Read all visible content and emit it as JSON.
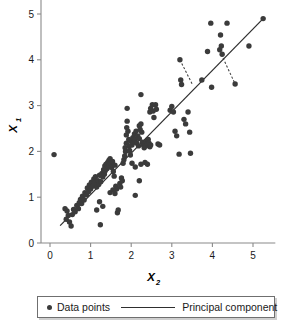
{
  "chart_data": {
    "type": "scatter",
    "title": "",
    "xlabel": "X",
    "xlabel_sub": "2",
    "ylabel": "X",
    "ylabel_sub": "1",
    "xlim": [
      -0.12,
      5.55
    ],
    "ylim": [
      -0.18,
      5.35
    ],
    "xticks": [
      0,
      1,
      2,
      3,
      4,
      5
    ],
    "yticks": [
      0,
      1,
      2,
      3,
      4,
      5
    ],
    "xticklabels": [
      "0",
      "1",
      "2",
      "3",
      "4",
      "5"
    ],
    "yticklabels": [
      "0",
      "1",
      "2",
      "3",
      "4",
      "5"
    ],
    "grid": false,
    "legend_position": "below-axes",
    "marker_color": "#3b3b3b",
    "line_color": "#2e2e2e",
    "axis_color": "#8a8a8a",
    "background": "#ffffff",
    "series": [
      {
        "name": "Data points",
        "type": "scatter",
        "marker": "circle",
        "color": "#3b3b3b",
        "points": [
          [
            0.1,
            1.93
          ],
          [
            0.37,
            0.75
          ],
          [
            0.42,
            0.7
          ],
          [
            0.45,
            0.6
          ],
          [
            0.4,
            0.52
          ],
          [
            0.48,
            0.46
          ],
          [
            0.52,
            0.37
          ],
          [
            0.55,
            0.62
          ],
          [
            0.58,
            0.73
          ],
          [
            0.62,
            0.68
          ],
          [
            0.66,
            0.82
          ],
          [
            0.7,
            0.75
          ],
          [
            0.72,
            0.88
          ],
          [
            0.75,
            0.95
          ],
          [
            0.78,
            0.86
          ],
          [
            0.8,
            1.02
          ],
          [
            0.84,
            0.94
          ],
          [
            0.86,
            1.1
          ],
          [
            0.9,
            1.05
          ],
          [
            0.92,
            1.2
          ],
          [
            0.95,
            1.12
          ],
          [
            0.97,
            1.27
          ],
          [
            1.0,
            1.18
          ],
          [
            1.02,
            1.33
          ],
          [
            1.05,
            1.24
          ],
          [
            1.08,
            1.4
          ],
          [
            1.1,
            1.3
          ],
          [
            1.12,
            1.45
          ],
          [
            1.15,
            1.22
          ],
          [
            1.18,
            1.36
          ],
          [
            1.2,
            1.28
          ],
          [
            1.22,
            1.48
          ],
          [
            1.24,
            0.4
          ],
          [
            1.25,
            1.34
          ],
          [
            1.28,
            1.52
          ],
          [
            1.3,
            1.44
          ],
          [
            1.32,
            1.6
          ],
          [
            1.34,
            1.5
          ],
          [
            1.35,
            1.68
          ],
          [
            1.36,
            1.58
          ],
          [
            1.38,
            1.72
          ],
          [
            1.4,
            1.62
          ],
          [
            1.42,
            1.76
          ],
          [
            1.44,
            1.66
          ],
          [
            1.45,
            1.8
          ],
          [
            1.46,
            1.7
          ],
          [
            1.48,
            1.84
          ],
          [
            1.5,
            1.74
          ],
          [
            1.52,
            1.65
          ],
          [
            1.54,
            1.78
          ],
          [
            1.56,
            1.56
          ],
          [
            1.58,
            1.46
          ],
          [
            1.6,
            1.7
          ],
          [
            1.62,
            1.24
          ],
          [
            1.64,
            1.18
          ],
          [
            1.66,
            0.66
          ],
          [
            1.68,
            0.72
          ],
          [
            1.15,
            0.72
          ],
          [
            1.22,
            0.9
          ],
          [
            1.3,
            0.8
          ],
          [
            1.48,
            1.1
          ],
          [
            1.55,
            1.16
          ],
          [
            1.6,
            1.08
          ],
          [
            1.72,
            1.3
          ],
          [
            1.74,
            1.22
          ],
          [
            1.76,
            1.42
          ],
          [
            1.78,
            1.36
          ],
          [
            1.8,
            1.74
          ],
          [
            1.82,
            1.82
          ],
          [
            1.84,
            1.9
          ],
          [
            1.85,
            2.08
          ],
          [
            1.86,
            2.0
          ],
          [
            1.88,
            2.18
          ],
          [
            1.88,
            2.36
          ],
          [
            1.89,
            2.52
          ],
          [
            1.9,
            2.66
          ],
          [
            1.9,
            2.94
          ],
          [
            1.92,
            2.44
          ],
          [
            1.94,
            2.26
          ],
          [
            1.95,
            2.12
          ],
          [
            1.96,
            2.02
          ],
          [
            1.98,
            1.92
          ],
          [
            2.0,
            2.22
          ],
          [
            2.02,
            2.14
          ],
          [
            2.04,
            2.3
          ],
          [
            2.06,
            2.2
          ],
          [
            2.08,
            2.38
          ],
          [
            2.1,
            2.26
          ],
          [
            2.12,
            2.44
          ],
          [
            2.14,
            2.18
          ],
          [
            2.16,
            2.34
          ],
          [
            2.18,
            2.12
          ],
          [
            2.2,
            2.28
          ],
          [
            2.2,
            2.56
          ],
          [
            2.22,
            2.48
          ],
          [
            2.24,
            2.6
          ],
          [
            2.24,
            3.24
          ],
          [
            2.26,
            2.42
          ],
          [
            2.28,
            2.2
          ],
          [
            2.3,
            2.14
          ],
          [
            2.32,
            2.08
          ],
          [
            2.34,
            2.18
          ],
          [
            2.36,
            2.12
          ],
          [
            2.38,
            2.22
          ],
          [
            2.4,
            2.16
          ],
          [
            2.42,
            2.26
          ],
          [
            2.44,
            2.18
          ],
          [
            2.46,
            2.1
          ],
          [
            2.48,
            2.14
          ],
          [
            2.1,
            1.04
          ],
          [
            2.2,
            1.36
          ],
          [
            2.02,
            1.74
          ],
          [
            2.1,
            1.66
          ],
          [
            2.24,
            1.72
          ],
          [
            2.34,
            1.76
          ],
          [
            2.4,
            1.72
          ],
          [
            2.46,
            2.86
          ],
          [
            2.48,
            2.94
          ],
          [
            2.52,
            3.02
          ],
          [
            2.54,
            2.88
          ],
          [
            2.56,
            2.74
          ],
          [
            2.6,
            3.02
          ],
          [
            2.62,
            2.92
          ],
          [
            2.66,
            2.16
          ],
          [
            2.7,
            2.14
          ],
          [
            2.96,
            2.9
          ],
          [
            3.0,
            2.98
          ],
          [
            3.04,
            2.86
          ],
          [
            3.08,
            2.44
          ],
          [
            3.12,
            2.34
          ],
          [
            3.18,
            1.94
          ],
          [
            3.2,
            4.0
          ],
          [
            3.22,
            3.56
          ],
          [
            3.24,
            3.46
          ],
          [
            3.3,
            2.7
          ],
          [
            3.34,
            2.6
          ],
          [
            3.4,
            2.86
          ],
          [
            3.44,
            2.42
          ],
          [
            3.46,
            1.96
          ],
          [
            3.74,
            3.56
          ],
          [
            3.88,
            4.18
          ],
          [
            3.96,
            4.8
          ],
          [
            3.98,
            3.4
          ],
          [
            4.18,
            4.22
          ],
          [
            4.2,
            4.54
          ],
          [
            4.22,
            4.3
          ],
          [
            4.24,
            4.12
          ],
          [
            4.36,
            4.8
          ],
          [
            4.56,
            3.47
          ],
          [
            4.9,
            4.3
          ],
          [
            5.25,
            4.9
          ]
        ]
      },
      {
        "name": "Principal component",
        "type": "line",
        "color": "#2e2e2e",
        "x_start": 0.25,
        "y_start": 0.38,
        "x_end": 5.25,
        "y_end": 4.9
      }
    ],
    "annotations": [
      {
        "name": "projection-residual-1",
        "style": "dashed",
        "from": [
          3.2,
          4.0
        ],
        "to": [
          3.52,
          3.44
        ]
      },
      {
        "name": "projection-residual-2",
        "style": "dashed",
        "from": [
          4.22,
          4.12
        ],
        "to": [
          4.56,
          3.47
        ]
      }
    ]
  },
  "legend": {
    "entries": [
      {
        "label": "Data points",
        "marker": "circle",
        "color": "#3b3b3b"
      },
      {
        "label": "Principal component",
        "marker": "line",
        "color": "#2e2e2e"
      }
    ]
  }
}
